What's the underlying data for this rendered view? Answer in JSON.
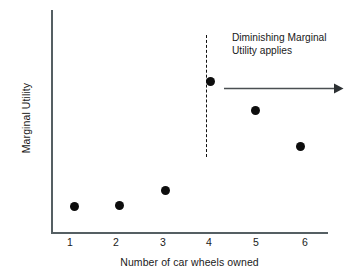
{
  "chart_data": {
    "type": "scatter",
    "title": "",
    "xlabel": "Number of car wheels owned",
    "ylabel": "Marginal Utility",
    "categories": [
      "1",
      "2",
      "3",
      "4",
      "5",
      "6"
    ],
    "x": [
      1,
      2,
      3,
      4,
      5,
      6
    ],
    "values": [
      12,
      12.5,
      19,
      68,
      55,
      39
    ],
    "xlim": [
      0.5,
      6.6
    ],
    "ylim": [
      0,
      100
    ],
    "grid": false,
    "legend": false,
    "legend_position": "none",
    "point_color": "#0d0d0d",
    "axis_color": "#555f63",
    "series": [
      {
        "name": "Marginal Utility",
        "points": [
          {
            "x": 1,
            "y": 12
          },
          {
            "x": 2,
            "y": 12.5
          },
          {
            "x": 3,
            "y": 19
          },
          {
            "x": 4,
            "y": 68
          },
          {
            "x": 5,
            "y": 55
          },
          {
            "x": 6,
            "y": 39
          }
        ]
      }
    ],
    "annotations": [
      {
        "type": "text",
        "lines": [
          "Diminishing Marginal",
          "Utility applies"
        ],
        "x": 4.4,
        "y": 92
      },
      {
        "type": "vline",
        "label": "threshold at 4 wheels",
        "x": 4,
        "style": "dashed",
        "color": "#111111"
      },
      {
        "type": "arrow",
        "label": "diminishing direction arrow",
        "x_start": 4.4,
        "x_end": 6.9,
        "y": 68,
        "direction": "right",
        "color": "#4a4f52"
      }
    ]
  },
  "axis": {
    "y_title": "Marginal Utility",
    "x_title": "Number of car wheels owned",
    "x_ticks": [
      "1",
      "2",
      "3",
      "4",
      "5",
      "6"
    ]
  },
  "annotation": {
    "line1": "Diminishing Marginal",
    "line2": "Utility applies"
  }
}
